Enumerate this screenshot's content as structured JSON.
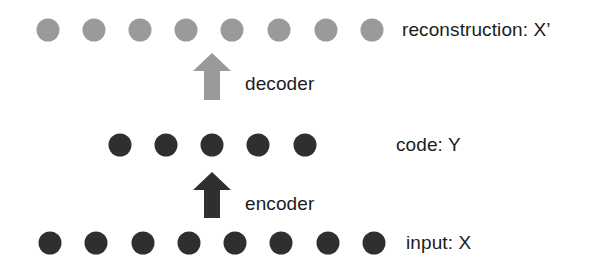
{
  "diagram": {
    "layers": [
      {
        "id": "reconstruction",
        "label": "reconstruction: X’",
        "nodes": 8,
        "color": "#9a9a9a",
        "y": 30,
        "node_x": [
          48,
          94,
          140,
          186,
          232,
          279,
          326,
          372
        ],
        "label_x": 402
      },
      {
        "id": "code",
        "label": "code: Y",
        "nodes": 5,
        "color": "#2f2f2f",
        "y": 145,
        "node_x": [
          120,
          166,
          212,
          258,
          305
        ],
        "label_x": 396
      },
      {
        "id": "input",
        "label": "input: X",
        "nodes": 8,
        "color": "#2f2f2f",
        "y": 243,
        "node_x": [
          50,
          96,
          143,
          189,
          235,
          281,
          328,
          374
        ],
        "label_x": 406
      }
    ],
    "arrows": [
      {
        "id": "decoder",
        "label": "decoder",
        "from": "code",
        "to": "reconstruction",
        "direction": "up",
        "color": "#9a9a9a",
        "x": 212,
        "top": 53,
        "height": 47,
        "label_x": 245,
        "label_y": 84
      },
      {
        "id": "encoder",
        "label": "encoder",
        "from": "input",
        "to": "code",
        "direction": "up",
        "color": "#2f2f2f",
        "x": 212,
        "top": 172,
        "height": 46,
        "label_x": 245,
        "label_y": 204
      }
    ]
  }
}
